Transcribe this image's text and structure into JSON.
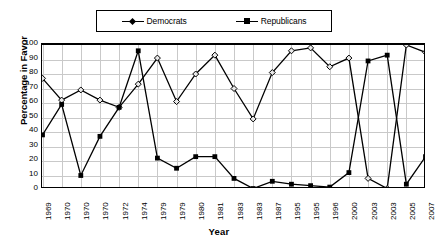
{
  "chart_data": {
    "type": "line",
    "title": "",
    "xlabel": "Year",
    "ylabel": "Percentage in Favor",
    "ylim": [
      0,
      100
    ],
    "ytick_step": 10,
    "yticks": [
      100,
      90,
      80,
      70,
      60,
      50,
      40,
      30,
      20,
      10,
      0
    ],
    "grid": true,
    "legend_position": "top",
    "categories": [
      "1969",
      "1970",
      "1970",
      "1970",
      "1972",
      "1974",
      "1979",
      "1979",
      "1980",
      "1981",
      "1983",
      "1983",
      "1987",
      "1995",
      "1995",
      "1996",
      "2000",
      "2003",
      "2003",
      "2005",
      "2007"
    ],
    "series": [
      {
        "name": "Democrats",
        "marker": "diamond",
        "color": "#000000",
        "values": [
          77,
          62,
          69,
          62,
          57,
          73,
          91,
          61,
          80,
          93,
          70,
          49,
          81,
          96,
          98,
          85,
          91,
          8,
          1,
          100,
          95
        ]
      },
      {
        "name": "Republicans",
        "marker": "square",
        "color": "#000000",
        "values": [
          38,
          59,
          10,
          37,
          57,
          96,
          22,
          15,
          23,
          23,
          8,
          1,
          6,
          4,
          3,
          2,
          12,
          89,
          93,
          4,
          23
        ]
      }
    ]
  },
  "legend": {
    "democrats_label": "Democrats",
    "republicans_label": "Republicans"
  },
  "axes": {
    "y_title": "Percentage in Favor",
    "x_title": "Year"
  }
}
